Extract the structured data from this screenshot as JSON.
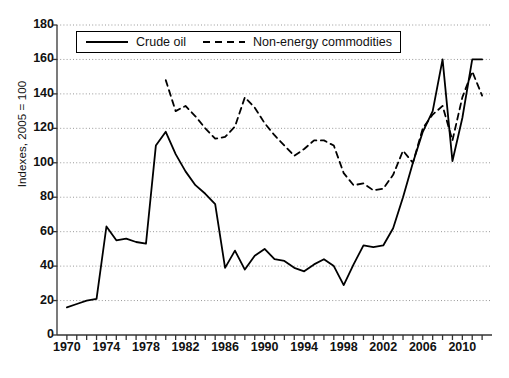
{
  "chart_data": {
    "type": "line",
    "title": "",
    "xlabel": "",
    "ylabel": "Indexes, 2005 = 100",
    "xlim": [
      1969,
      2013
    ],
    "ylim": [
      0,
      180
    ],
    "ytick_step": 20,
    "yticks": [
      0,
      20,
      40,
      60,
      80,
      100,
      120,
      140,
      160,
      180
    ],
    "xticks": [
      1970,
      1971,
      1972,
      1973,
      1974,
      1975,
      1976,
      1977,
      1978,
      1979,
      1980,
      1981,
      1982,
      1983,
      1984,
      1985,
      1986,
      1987,
      1988,
      1989,
      1990,
      1991,
      1992,
      1993,
      1994,
      1995,
      1996,
      1997,
      1998,
      1999,
      2000,
      2001,
      2002,
      2003,
      2004,
      2005,
      2006,
      2007,
      2008,
      2009,
      2010,
      2011,
      2012
    ],
    "xtick_labels": [
      1970,
      1974,
      1978,
      1982,
      1986,
      1990,
      1994,
      1998,
      2002,
      2006,
      2010
    ],
    "grid": "horizontal-dotted",
    "legend_position": "top-left-inside",
    "series": [
      {
        "name": "Crude oil",
        "style": "solid",
        "color": "#000000",
        "x": [
          1970,
          1971,
          1972,
          1973,
          1974,
          1975,
          1976,
          1977,
          1978,
          1979,
          1980,
          1981,
          1982,
          1983,
          1984,
          1985,
          1986,
          1987,
          1988,
          1989,
          1990,
          1991,
          1992,
          1993,
          1994,
          1995,
          1996,
          1997,
          1998,
          1999,
          2000,
          2001,
          2002,
          2003,
          2004,
          2005,
          2006,
          2007,
          2008,
          2009,
          2010,
          2011,
          2012
        ],
        "values": [
          16,
          18,
          20,
          21,
          63,
          55,
          56,
          54,
          53,
          110,
          118,
          105,
          95,
          87,
          82,
          76,
          39,
          49,
          38,
          46,
          50,
          44,
          43,
          39,
          37,
          41,
          44,
          40,
          29,
          41,
          52,
          51,
          52,
          62,
          80,
          100,
          118,
          130,
          160,
          101,
          126,
          160,
          160
        ],
        "annotations": [
          "1974 first oil shock",
          "1979-80 second oil shock",
          "1986 price collapse",
          "2008 peak",
          "2009 crash"
        ]
      },
      {
        "name": "Non-energy commodities",
        "style": "dashed",
        "color": "#000000",
        "x": [
          1980,
          1981,
          1982,
          1983,
          1984,
          1985,
          1986,
          1987,
          1988,
          1989,
          1990,
          1991,
          1992,
          1993,
          1994,
          1995,
          1996,
          1997,
          1998,
          1999,
          2000,
          2001,
          2002,
          2003,
          2004,
          2005,
          2006,
          2007,
          2008,
          2009,
          2010,
          2011,
          2012
        ],
        "values": [
          148,
          130,
          133,
          127,
          120,
          114,
          115,
          121,
          138,
          132,
          123,
          116,
          110,
          104,
          108,
          113,
          113,
          110,
          94,
          87,
          88,
          84,
          85,
          93,
          107,
          100,
          120,
          128,
          133,
          113,
          138,
          153,
          139
        ]
      }
    ]
  },
  "legend": {
    "items": [
      {
        "label": "Crude oil",
        "style": "solid"
      },
      {
        "label": "Non-energy commodities",
        "style": "dashed"
      }
    ]
  }
}
